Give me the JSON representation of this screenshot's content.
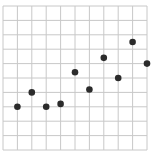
{
  "chart_data": {
    "type": "scatter",
    "title": "",
    "xlabel": "",
    "ylabel": "",
    "grid": true,
    "xlim": [
      0,
      10
    ],
    "ylim": [
      0,
      10
    ],
    "x": [
      1,
      2,
      3,
      4,
      5,
      6,
      7,
      8,
      9,
      10
    ],
    "y": [
      3.0,
      4.0,
      3.0,
      3.2,
      5.4,
      4.2,
      6.4,
      5.0,
      7.5,
      6.0
    ],
    "legend": [],
    "colors": {
      "point": "#2b2b2b",
      "grid": "#c8c8c8",
      "background": "#ffffff"
    }
  },
  "layout": {
    "plot_left": 3,
    "plot_top": 6,
    "plot_width": 144,
    "plot_height": 144,
    "grid_divisions": 10,
    "point_radius": 3.3
  }
}
